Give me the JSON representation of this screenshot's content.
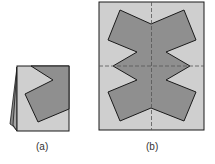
{
  "figures": [
    {
      "id": "a",
      "caption": "(a)",
      "description": "folded paper with cut shape"
    },
    {
      "id": "b",
      "caption": "(b)",
      "description": "unfolded paper showing symmetric cut shape with fold lines"
    }
  ],
  "colors": {
    "paper": "#cfcfcf",
    "shape": "#8f8f8f",
    "outline": "#1a1a1a",
    "fold_line": "#555555"
  }
}
